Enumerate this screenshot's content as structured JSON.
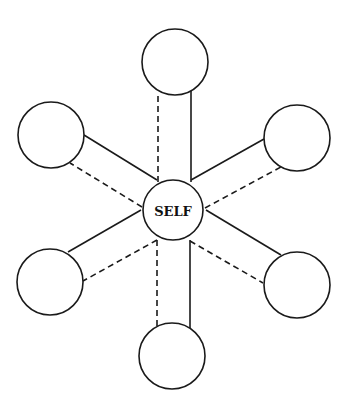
{
  "diagram": {
    "type": "radial-relationship-diagram",
    "center": {
      "label": "SELF",
      "cx": 173,
      "cy": 210,
      "r": 30
    },
    "colors": {
      "stroke": "#1a1a1a",
      "background": "#ffffff",
      "fill": "#ffffff"
    },
    "nodes": [
      {
        "id": "top",
        "label": "",
        "cx": 175,
        "cy": 62,
        "r": 33
      },
      {
        "id": "upper-left",
        "label": "",
        "cx": 51,
        "cy": 135,
        "r": 33
      },
      {
        "id": "upper-right",
        "label": "",
        "cx": 297,
        "cy": 138,
        "r": 33
      },
      {
        "id": "lower-left",
        "label": "",
        "cx": 50,
        "cy": 282,
        "r": 33
      },
      {
        "id": "lower-right",
        "label": "",
        "cx": 297,
        "cy": 285,
        "r": 33
      },
      {
        "id": "bottom",
        "label": "",
        "cx": 172,
        "cy": 356,
        "r": 33
      }
    ],
    "edges": [
      {
        "to": "top",
        "style": "dashed",
        "x1": 158,
        "y1": 182,
        "x2": 158,
        "y2": 92
      },
      {
        "to": "top",
        "style": "solid",
        "x1": 191,
        "y1": 182,
        "x2": 191,
        "y2": 91
      },
      {
        "to": "upper-left",
        "style": "solid",
        "x1": 157,
        "y1": 180,
        "x2": 84,
        "y2": 135
      },
      {
        "to": "upper-left",
        "style": "dashed",
        "x1": 142,
        "y1": 207,
        "x2": 70,
        "y2": 163
      },
      {
        "to": "upper-right",
        "style": "solid",
        "x1": 191,
        "y1": 180,
        "x2": 264,
        "y2": 139
      },
      {
        "to": "upper-right",
        "style": "dashed",
        "x1": 205,
        "y1": 208,
        "x2": 281,
        "y2": 167
      },
      {
        "to": "lower-left",
        "style": "solid",
        "x1": 141,
        "y1": 210,
        "x2": 68,
        "y2": 252
      },
      {
        "to": "lower-left",
        "style": "dashed",
        "x1": 157,
        "y1": 240,
        "x2": 83,
        "y2": 281
      },
      {
        "to": "lower-right",
        "style": "solid",
        "x1": 206,
        "y1": 210,
        "x2": 281,
        "y2": 255
      },
      {
        "to": "lower-right",
        "style": "dashed",
        "x1": 190,
        "y1": 241,
        "x2": 263,
        "y2": 283
      },
      {
        "to": "bottom",
        "style": "dashed",
        "x1": 157,
        "y1": 240,
        "x2": 157,
        "y2": 326
      },
      {
        "to": "bottom",
        "style": "solid",
        "x1": 190,
        "y1": 240,
        "x2": 190,
        "y2": 329
      }
    ]
  }
}
